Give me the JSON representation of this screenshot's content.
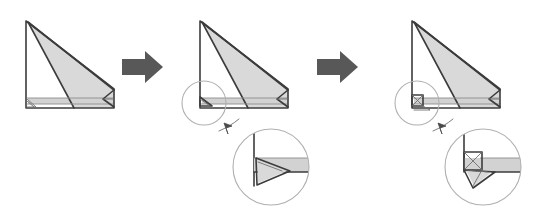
{
  "figure": {
    "background_color": "#ffffff",
    "width": 535,
    "height": 221,
    "outline_color": "#3c3c3c",
    "shade_color": "#d9d9d9",
    "crease_color": "#8c8c8c",
    "arrow_color": "#585858",
    "lens_color": "#b0b0b0"
  },
  "steps": [
    {
      "id": "step-1",
      "label": "Step 1",
      "caption": "",
      "has_magnifier": false,
      "corner_detail": "small-flap"
    },
    {
      "id": "step-2",
      "label": "Step 2",
      "caption": "",
      "has_magnifier": true,
      "corner_detail": "triangle-fold"
    },
    {
      "id": "step-3",
      "label": "Step 3",
      "caption": "",
      "has_magnifier": true,
      "corner_detail": "squash-fold-x"
    }
  ],
  "arrows": [
    {
      "id": "arrow-1",
      "label": "Next step",
      "direction": "right"
    },
    {
      "id": "arrow-2",
      "label": "Next step",
      "direction": "right"
    }
  ],
  "callouts": [
    {
      "id": "callout-1",
      "label": "Detail view of left corner"
    },
    {
      "id": "callout-2",
      "label": "Detail view of left corner"
    }
  ]
}
